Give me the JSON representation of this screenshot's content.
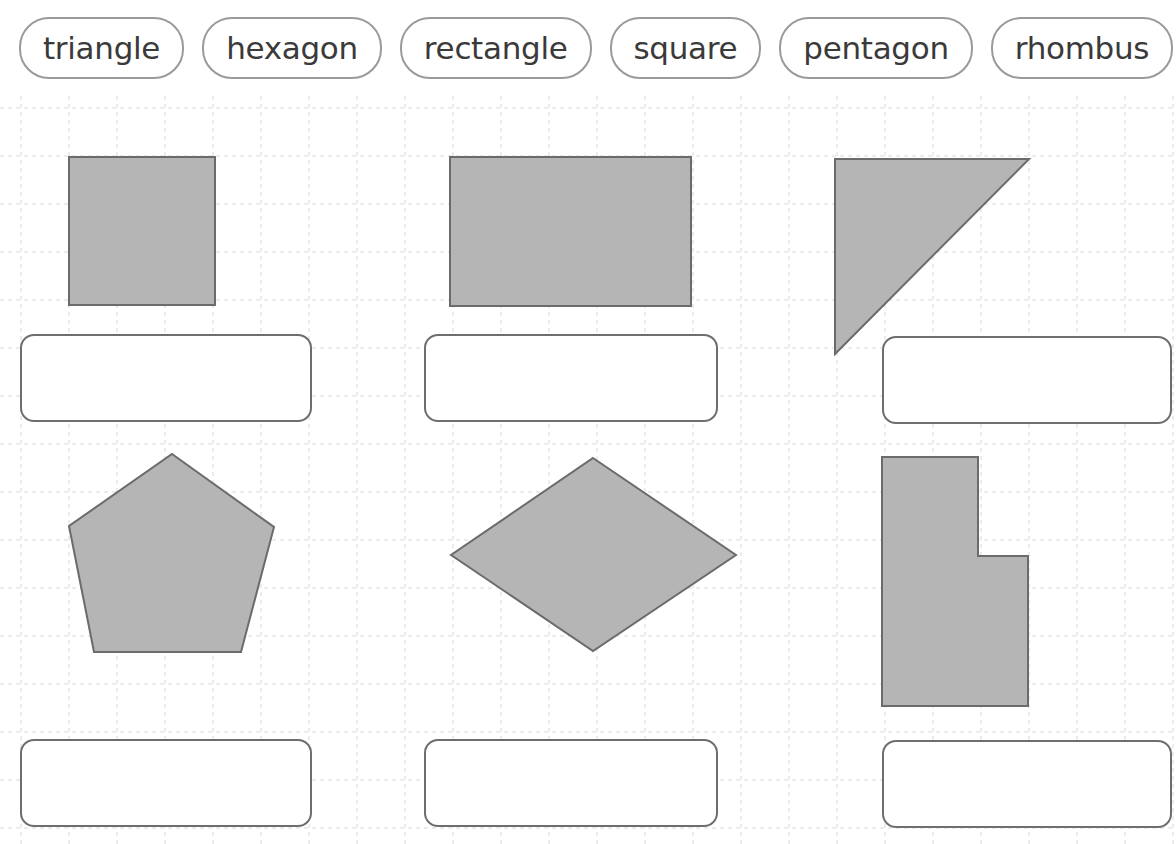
{
  "worksheet": {
    "title_fragment": "",
    "shape_fill": "#b5b5b5",
    "shape_stroke": "#6b6b6b",
    "grid_color": "#d8d8d8",
    "box_stroke": "#6e6e6e",
    "pill_stroke": "#9a9a9a",
    "text_color": "#3a3a3a",
    "grid_spacing": 48
  },
  "word_bank": {
    "label": "word-bank",
    "words": [
      {
        "label": "triangle"
      },
      {
        "label": "hexagon"
      },
      {
        "label": "rectangle"
      },
      {
        "label": "square"
      },
      {
        "label": "pentagon"
      },
      {
        "label": "rhombus"
      }
    ]
  },
  "shapes": [
    {
      "id": "shape-1",
      "name": "square",
      "kind": "rect",
      "answer": "square",
      "geometry": {
        "x": 69,
        "y": 157,
        "width": 146,
        "height": 148
      },
      "points": ""
    },
    {
      "id": "shape-2",
      "name": "rectangle",
      "kind": "rect",
      "answer": "rectangle",
      "geometry": {
        "x": 450,
        "y": 157,
        "width": 241,
        "height": 149
      },
      "points": ""
    },
    {
      "id": "shape-3",
      "name": "right-triangle",
      "kind": "polygon",
      "answer": "triangle",
      "geometry": {},
      "points": "835,159 1029,159 835,354"
    },
    {
      "id": "shape-4",
      "name": "pentagon",
      "kind": "polygon",
      "answer": "pentagon",
      "geometry": {},
      "points": "172,454 274,527 241,652 94,652 69,526"
    },
    {
      "id": "shape-5",
      "name": "rhombus",
      "kind": "polygon",
      "answer": "rhombus",
      "geometry": {},
      "points": "593,458 736,555 593,651 451,555"
    },
    {
      "id": "shape-6",
      "name": "l-shaped-hexagon",
      "kind": "polygon",
      "answer": "hexagon",
      "geometry": {},
      "points": "882,457 978,457 978,556 1028,556 1028,706 882,706"
    }
  ],
  "answer_boxes": [
    {
      "id": "answer-1",
      "for_shape": "square",
      "value": "",
      "placeholder": "",
      "geometry": {
        "x": 20,
        "y": 334,
        "width": 292,
        "height": 88
      }
    },
    {
      "id": "answer-2",
      "for_shape": "rectangle",
      "value": "",
      "placeholder": "",
      "geometry": {
        "x": 424,
        "y": 334,
        "width": 294,
        "height": 88
      }
    },
    {
      "id": "answer-3",
      "for_shape": "triangle",
      "value": "",
      "placeholder": "",
      "geometry": {
        "x": 882,
        "y": 336,
        "width": 290,
        "height": 88
      }
    },
    {
      "id": "answer-4",
      "for_shape": "pentagon",
      "value": "",
      "placeholder": "",
      "geometry": {
        "x": 20,
        "y": 739,
        "width": 292,
        "height": 88
      }
    },
    {
      "id": "answer-5",
      "for_shape": "rhombus",
      "value": "",
      "placeholder": "",
      "geometry": {
        "x": 424,
        "y": 739,
        "width": 294,
        "height": 88
      }
    },
    {
      "id": "answer-6",
      "for_shape": "hexagon",
      "value": "",
      "placeholder": "",
      "geometry": {
        "x": 882,
        "y": 740,
        "width": 290,
        "height": 88
      }
    }
  ]
}
